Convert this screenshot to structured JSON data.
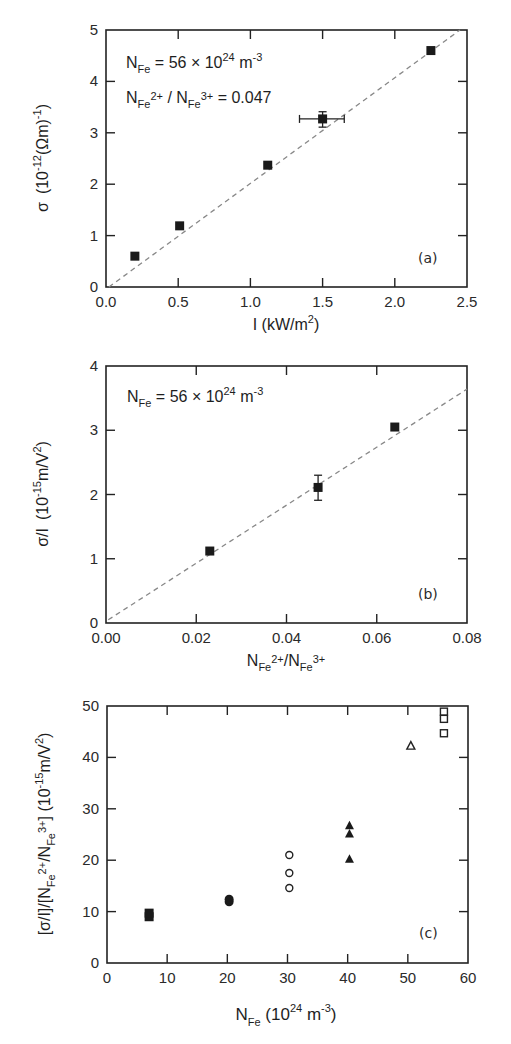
{
  "chart_data": [
    {
      "type": "scatter",
      "panel_label": "(a)",
      "xlabel": {
        "main": "I (kW/m",
        "sup": "2",
        "tail": ")"
      },
      "ylabel": {
        "sigma": "σ",
        "pre": "(10",
        "sup": "-12",
        "mid": "(Ωm)",
        "sup2": "-1",
        "tail": ")"
      },
      "xlim": [
        0,
        2.5
      ],
      "ylim": [
        0,
        5
      ],
      "xticks": [
        "0.0",
        "0.5",
        "1.0",
        "1.5",
        "2.0",
        "2.5"
      ],
      "xtick_values": [
        0,
        0.5,
        1.0,
        1.5,
        2.0,
        2.5
      ],
      "yticks": [
        "0",
        "1",
        "2",
        "3",
        "4",
        "5"
      ],
      "ytick_values": [
        0,
        1,
        2,
        3,
        4,
        5
      ],
      "annotations": [
        {
          "N": "N",
          "sub": "Fe",
          "text": " = 56 × 10",
          "sup": "24",
          "tail": " m",
          "sup2": "-3"
        },
        {
          "N": "N",
          "sub": "Fe",
          "sup": "2+",
          "mid": " / N",
          "sub2": "Fe",
          "sup2": "3+",
          "tail": " = 0.047"
        }
      ],
      "series": [
        {
          "name": "data",
          "marker": "filled-square",
          "points": [
            {
              "x": 0.2,
              "y": 0.6
            },
            {
              "x": 0.51,
              "y": 1.19
            },
            {
              "x": 1.12,
              "y": 2.37
            },
            {
              "x": 1.5,
              "y": 3.27,
              "xerr": [
                1.34,
                1.65
              ],
              "yerr": [
                3.11,
                3.41
              ]
            },
            {
              "x": 2.25,
              "y": 4.6
            }
          ]
        }
      ],
      "fit_line": {
        "style": "dashed",
        "x0": 0.02,
        "y0": 0.0,
        "x1": 2.5,
        "y1": 5.1
      }
    },
    {
      "type": "scatter",
      "panel_label": "(b)",
      "xlabel": {
        "N": "N",
        "sub": "Fe",
        "sup": "2+",
        "mid": "/N",
        "sub2": "Fe",
        "sup2": "3+"
      },
      "ylabel": {
        "main": "σ/I",
        "pre": "(10",
        "sup": "-15",
        "mid": "m/V",
        "sup2": "2",
        "tail": ")"
      },
      "xlim": [
        0,
        0.08
      ],
      "ylim": [
        0,
        4
      ],
      "xticks": [
        "0.00",
        "0.02",
        "0.04",
        "0.06",
        "0.08"
      ],
      "xtick_values": [
        0,
        0.02,
        0.04,
        0.06,
        0.08
      ],
      "yticks": [
        "0",
        "1",
        "2",
        "3",
        "4"
      ],
      "ytick_values": [
        0,
        1,
        2,
        3,
        4
      ],
      "annotations": [
        {
          "N": "N",
          "sub": "Fe",
          "text": " = 56 × 10",
          "sup": "24",
          "tail": " m",
          "sup2": "-3"
        }
      ],
      "series": [
        {
          "name": "data",
          "marker": "filled-square",
          "points": [
            {
              "x": 0.023,
              "y": 1.12
            },
            {
              "x": 0.047,
              "y": 2.11,
              "yerr": [
                1.91,
                2.3
              ]
            },
            {
              "x": 0.064,
              "y": 3.05
            }
          ]
        }
      ],
      "fit_line": {
        "style": "dashed",
        "x0": 0.0005,
        "y0": 0.05,
        "x1": 0.08,
        "y1": 3.64
      }
    },
    {
      "type": "scatter",
      "panel_label": "(c)",
      "xlabel": {
        "N": "N",
        "sub": "Fe",
        "text": " (10",
        "sup": "24",
        "tail": " m",
        "sup2": "-3",
        "close": ")"
      },
      "ylabel": {
        "pre": "[σ/I]/[N",
        "sub": "Fe",
        "sup": "2+",
        "mid": "/N",
        "sub2": "Fe",
        "sup2": "3+",
        "mid2": "] (10",
        "sup3": "-15",
        "tail": "m/V",
        "sup4": "2",
        "close": ")"
      },
      "xlim": [
        0,
        60
      ],
      "ylim": [
        0,
        50
      ],
      "xticks": [
        "0",
        "10",
        "20",
        "30",
        "40",
        "50",
        "60"
      ],
      "xtick_values": [
        0,
        10,
        20,
        30,
        40,
        50,
        60
      ],
      "yticks": [
        "0",
        "10",
        "20",
        "30",
        "40",
        "50"
      ],
      "ytick_values": [
        0,
        10,
        20,
        30,
        40,
        50
      ],
      "series": [
        {
          "name": "N_Fe=7",
          "marker": "filled-square",
          "points": [
            {
              "x": 7,
              "y": 9.0
            },
            {
              "x": 7,
              "y": 9.7
            }
          ]
        },
        {
          "name": "N_Fe=20",
          "marker": "filled-circle",
          "points": [
            {
              "x": 20.3,
              "y": 11.9
            },
            {
              "x": 20.3,
              "y": 12.4
            }
          ]
        },
        {
          "name": "N_Fe=30",
          "marker": "open-circle",
          "points": [
            {
              "x": 30.3,
              "y": 21.0
            },
            {
              "x": 30.3,
              "y": 17.5
            },
            {
              "x": 30.3,
              "y": 14.6
            }
          ]
        },
        {
          "name": "N_Fe=40",
          "marker": "filled-triangle",
          "points": [
            {
              "x": 40.3,
              "y": 26.7
            },
            {
              "x": 40.3,
              "y": 25.1
            },
            {
              "x": 40.3,
              "y": 20.2
            }
          ]
        },
        {
          "name": "N_Fe=50",
          "marker": "open-triangle",
          "points": [
            {
              "x": 50.5,
              "y": 42.2
            }
          ]
        },
        {
          "name": "N_Fe=56",
          "marker": "open-square",
          "points": [
            {
              "x": 56,
              "y": 48.9
            },
            {
              "x": 56,
              "y": 47.5
            },
            {
              "x": 56,
              "y": 44.7
            }
          ]
        }
      ]
    }
  ]
}
